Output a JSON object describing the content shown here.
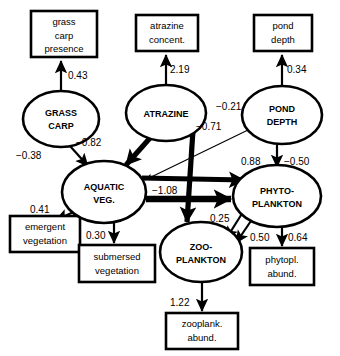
{
  "diagram": {
    "type": "path-diagram",
    "latent_nodes": [
      {
        "id": "grass_carp",
        "label_line1": "GRASS",
        "label_line2": "CARP",
        "cx": 61,
        "cy": 119,
        "rx": 38,
        "ry": 28
      },
      {
        "id": "atrazine",
        "label_line1": "ATRAZINE",
        "label_line2": "",
        "cx": 166,
        "cy": 113,
        "rx": 40,
        "ry": 28
      },
      {
        "id": "pond_depth",
        "label_line1": "POND",
        "label_line2": "DEPTH",
        "cx": 282,
        "cy": 115,
        "rx": 40,
        "ry": 29
      },
      {
        "id": "aquatic_veg",
        "label_line1": "AQUATIC",
        "label_line2": "VEG.",
        "cx": 104,
        "cy": 192,
        "rx": 42,
        "ry": 31
      },
      {
        "id": "phytoplankton",
        "label_line1": "PHYTO-",
        "label_line2": "PLANKTON",
        "cx": 277,
        "cy": 196,
        "rx": 44,
        "ry": 31
      },
      {
        "id": "zooplankton",
        "label_line1": "ZOO-",
        "label_line2": "PLANKTON",
        "cx": 201,
        "cy": 252,
        "rx": 41,
        "ry": 30
      }
    ],
    "indicator_boxes": [
      {
        "id": "grass_carp_presence",
        "lines": [
          "grass",
          "carp",
          "presence"
        ],
        "x": 31,
        "y": 11,
        "w": 66,
        "h": 46
      },
      {
        "id": "atrazine_concent",
        "lines": [
          "atrazine",
          "concent."
        ],
        "x": 136,
        "y": 15,
        "w": 62,
        "h": 36
      },
      {
        "id": "pond_depth_ind",
        "lines": [
          "pond",
          "depth"
        ],
        "x": 254,
        "y": 15,
        "w": 58,
        "h": 36
      },
      {
        "id": "emergent_vegetation",
        "lines": [
          "emergent",
          "vegetation"
        ],
        "x": 10,
        "y": 216,
        "w": 70,
        "h": 36
      },
      {
        "id": "submersed_vegetation",
        "lines": [
          "submersed",
          "vegetation"
        ],
        "x": 79,
        "y": 245,
        "w": 76,
        "h": 37
      },
      {
        "id": "phytopl_abund",
        "lines": [
          "phytopl.",
          "abund."
        ],
        "x": 250,
        "y": 248,
        "w": 64,
        "h": 37
      },
      {
        "id": "zooplank_abund",
        "lines": [
          "zooplank.",
          "abund."
        ],
        "x": 166,
        "y": 313,
        "w": 72,
        "h": 36
      }
    ],
    "paths": [
      {
        "id": "grass_carp-to-presence",
        "from": "grass_carp",
        "to": "grass_carp_presence",
        "coefficient": "0.43",
        "weight": "med",
        "label_x": 68,
        "label_y": 79
      },
      {
        "id": "atrazine-to-concent",
        "from": "atrazine",
        "to": "atrazine_concent",
        "coefficient": "2.19",
        "weight": "med",
        "label_x": 170,
        "label_y": 73
      },
      {
        "id": "pond_depth-to-indicator",
        "from": "pond_depth",
        "to": "pond_depth_ind",
        "coefficient": "0.34",
        "weight": "med",
        "label_x": 287,
        "label_y": 73
      },
      {
        "id": "grass_carp-to-aquatic_veg",
        "from": "grass_carp",
        "to": "aquatic_veg",
        "coefficient": "−0.38",
        "weight": "med",
        "label_x": 24,
        "label_y": 156
      },
      {
        "id": "atrazine-to-aquatic_veg",
        "from": "atrazine",
        "to": "aquatic_veg",
        "coefficient": "−0.82",
        "weight": "thick",
        "label_x": 82,
        "label_y": 145
      },
      {
        "id": "pond_depth-to-aquatic_veg",
        "from": "pond_depth",
        "to": "aquatic_veg",
        "coefficient": "−0.21",
        "weight": "thin",
        "label_x": 221,
        "label_y": 110
      },
      {
        "id": "atrazine-to-zooplankton",
        "from": "atrazine",
        "to": "zooplankton",
        "coefficient": "−0.71",
        "weight": "thick",
        "label_x": 203,
        "label_y": 127
      },
      {
        "id": "aquatic_veg-to-phytoplankton",
        "from": "aquatic_veg",
        "to": "phytoplankton",
        "coefficient": "−1.08",
        "weight": "xthick",
        "label_x": 160,
        "label_y": 190
      },
      {
        "id": "aquatic_veg-to-phyto-diag",
        "from": "aquatic_veg",
        "to": "phytoplankton",
        "coefficient": "0.88",
        "weight": "thick",
        "label_x": 240,
        "label_y": 167
      },
      {
        "id": "pond_depth-to-phytoplankton",
        "from": "pond_depth",
        "to": "phytoplankton",
        "coefficient": "−0.50",
        "weight": "med",
        "label_x": 288,
        "label_y": 167
      },
      {
        "id": "aquatic_veg-to-emergent",
        "from": "aquatic_veg",
        "to": "emergent_vegetation",
        "coefficient": "0.41",
        "weight": "med",
        "label_x": 37,
        "label_y": 212
      },
      {
        "id": "aquatic_veg-to-submersed",
        "from": "aquatic_veg",
        "to": "submersed_vegetation",
        "coefficient": "0.30",
        "weight": "med",
        "label_x": 92,
        "label_y": 236
      },
      {
        "id": "phytoplankton-to-zooplankton",
        "from": "phytoplankton",
        "to": "zooplankton",
        "coefficient": "0.25",
        "weight": "med",
        "label_x": 213,
        "label_y": 219
      },
      {
        "id": "zooplankton-to-phytoplankton",
        "from": "zooplankton",
        "to": "phytoplankton",
        "coefficient": "0.50",
        "weight": "med",
        "label_x": 254,
        "label_y": 238
      },
      {
        "id": "phytoplankton-to-abund",
        "from": "phytoplankton",
        "to": "phytopl_abund",
        "coefficient": "0.64",
        "weight": "med",
        "label_x": 292,
        "label_y": 238
      },
      {
        "id": "zooplankton-to-abund",
        "from": "zooplankton",
        "to": "zooplank_abund",
        "coefficient": "1.22",
        "weight": "med",
        "label_x": 175,
        "label_y": 303
      }
    ],
    "colors": {
      "stroke": "#000000",
      "fill": "#ffffff",
      "text": "#000000"
    }
  }
}
